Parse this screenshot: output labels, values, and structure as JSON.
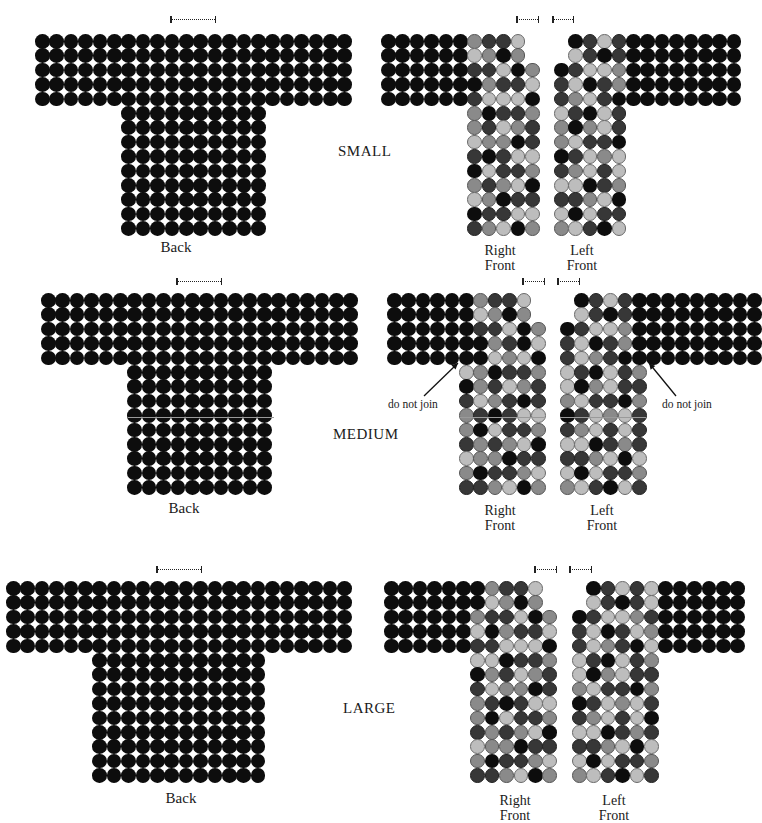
{
  "colors": {
    "D": "#0d0d0d",
    "K": "#373737",
    "M": "#8a8a8a",
    "L": "#bdbdbd"
  },
  "legend_keys": {
    "D": "black",
    "K": "dark gray",
    "M": "medium gray",
    "L": "light gray"
  },
  "sizes": [
    {
      "name": "SMALL",
      "label_pos": [
        338,
        143
      ],
      "back": {
        "label": "Back",
        "label_pos": [
          176,
          240
        ],
        "origin": [
          35,
          34
        ],
        "pitch": 14.4,
        "rows": [
          "DDDDDDDDDDDDDDDDDDDDDD",
          "DDDDDDDDDDDDDDDDDDDDDD",
          "DDDDDDDDDDDDDDDDDDDDDD",
          "DDDDDDDDDDDDDDDDDDDDDD",
          "DDDDDDDDDDDDDDDDDDDDDD",
          "......DDDDDDDDDD",
          "......DDDDDDDDDD",
          "......DDDDDDDDDD",
          "......DDDDDDDDDD",
          "......DDDDDDDDDD",
          "......DDDDDDDDDD",
          "......DDDDDDDDDD",
          "......DDDDDDDDDD",
          "......DDDDDDDDDD"
        ],
        "marker": [
          171,
          19,
          44
        ]
      },
      "right_front": {
        "label": "Right\nFront",
        "label_pos": [
          500,
          243
        ],
        "origin": [
          381,
          34
        ],
        "pitch": 14.4,
        "rows": [
          "DDDDDDMKKL",
          "DDDDDDLMDM",
          "DDDDDDKKLDM",
          "DDDDDDDMKKL",
          "DDDDDDKLLLD",
          "......MDKKM",
          "......MKLMK",
          "......LMMDK",
          "......KDKLL",
          "......DLKKM",
          "......MKMLD",
          "......LMDKK",
          "......DKKLL",
          "......KMLDM"
        ],
        "marker": [
          517,
          19,
          21
        ]
      },
      "left_front": {
        "label": "Left\nFront",
        "label_pos": [
          582,
          243
        ],
        "origin": [
          554,
          34
        ],
        "pitch": 14.4,
        "rows": [
          ".DKLKDDDDDDDD",
          ".LKDKDDDDDDDD",
          "DKLLMDDDDDDDD",
          "KLDKMDDDDDDDD",
          "KMLKDDDDDDDDD",
          "LKDLK",
          "MDMLK",
          "MLKKD",
          "DKLML",
          "KMLKL",
          "LLDKM",
          "KKMLD",
          "LDLKK",
          "MLKDL"
        ],
        "marker": [
          553,
          19,
          20
        ]
      },
      "notes": []
    },
    {
      "name": "MEDIUM",
      "label_pos": [
        333,
        426
      ],
      "back": {
        "label": "Back",
        "label_pos": [
          184,
          501
        ],
        "origin": [
          41,
          293
        ],
        "pitch": 14.4,
        "rows": [
          "DDDDDDDDDDDDDDDDDDDDDD",
          "DDDDDDDDDDDDDDDDDDDDDD",
          "DDDDDDDDDDDDDDDDDDDDDD",
          "DDDDDDDDDDDDDDDDDDDDDD",
          "DDDDDDDDDDDDDDDDDDDDDD",
          "......DDDDDDDDDD",
          "......DDDDDDDDDD",
          "......DDDDDDDDDD",
          "......DDDDDDDDDD",
          "......DDDDDDDDDD",
          "......DDDDDDDDDD",
          "......DDDDDDDDDD",
          "......DDDDDDDDDD",
          "......DDDDDDDDDD"
        ],
        "marker": [
          177,
          281,
          44
        ],
        "hline": [
          128,
          417,
          146
        ]
      },
      "right_front": {
        "label": "Right\nFront",
        "label_pos": [
          500,
          503
        ],
        "origin": [
          387,
          293
        ],
        "pitch": 14.4,
        "rows": [
          "DDDDDDMKKL",
          "DDDDDDLMDM",
          "DDDDDDKKLDM",
          "DDDDDDDMKDL",
          "DDDDDDDLMLD",
          ".....LMDKKM",
          ".....DMKLMK",
          ".....KLMKDK",
          ".....MKDKLL",
          ".....MDLKKM",
          ".....KMKMLD",
          ".....LMMDKK",
          ".....MDKKML",
          ".....KKMLDM"
        ],
        "marker": [
          523,
          281,
          21
        ],
        "hline": [
          460,
          417,
          84
        ]
      },
      "left_front": {
        "label": "Left\nFront",
        "label_pos": [
          602,
          503
        ],
        "origin": [
          560,
          293
        ],
        "pitch": 14.4,
        "rows": [
          ".DKLKDDDDDDDDD",
          ".LKDKDDDDDDDDD",
          "DKLLMDDDDDDDDD",
          "KLDKMDDDDDDDDD",
          "KLMKDDDDDDDDDD",
          "LKDLKM",
          "LDMLKK",
          "MLKKDM",
          "DKLMLK",
          "KMLKLK",
          "LLDKMK",
          "KKMLDL",
          "LDLKKM",
          "MLKDLK"
        ],
        "marker": [
          558,
          281,
          21
        ],
        "hline": [
          560,
          417,
          86
        ]
      },
      "notes": [
        {
          "text": "do not join",
          "pos": [
            388,
            398
          ],
          "arrow": [
            [
              424,
              396
            ],
            [
              458,
              363
            ]
          ]
        },
        {
          "text": "do not join",
          "pos": [
            662,
            398
          ],
          "arrow": [
            [
              676,
              396
            ],
            [
              649,
              363
            ]
          ]
        }
      ]
    },
    {
      "name": "LARGE",
      "label_pos": [
        343,
        700
      ],
      "back": {
        "label": "Back",
        "label_pos": [
          181,
          791
        ],
        "origin": [
          6,
          581
        ],
        "pitch": 14.4,
        "rows": [
          "DDDDDDDDDDDDDDDDDDDDDDDD",
          "DDDDDDDDDDDDDDDDDDDDDDDD",
          "DDDDDDDDDDDDDDDDDDDDDDDD",
          "DDDDDDDDDDDDDDDDDDDDDDDD",
          "DDDDDDDDDDDDDDDDDDDDDDDD",
          "......DDDDDDDDDDDD",
          "......DDDDDDDDDDDD",
          "......DDDDDDDDDDDD",
          "......DDDDDDDDDDDD",
          "......DDDDDDDDDDDD",
          "......DDDDDDDDDDDD",
          "......DDDDDDDDDDDD",
          "......DDDDDDDDDDDD",
          "......DDDDDDDDDDDD"
        ],
        "marker": [
          157,
          569,
          44
        ]
      },
      "right_front": {
        "label": "Right\nFront",
        "label_pos": [
          515,
          793
        ],
        "origin": [
          384,
          581
        ],
        "pitch": 14.4,
        "rows": [
          "DDDDDDDMKKL",
          "DDDDDDDLMDM",
          "DDDDDDMKKLDM",
          "DDDDDDLDMKKL",
          "DDDDDDKKLLLD",
          "......LLDKKM",
          "......DMKLMK",
          "......KLMMDK",
          "......MKDKLL",
          "......MDLKKM",
          "......KMKMLD",
          "......LMMDKK",
          "......MDKKML",
          "......KKMLDM"
        ],
        "marker": [
          535,
          569,
          21
        ]
      },
      "left_front": {
        "label": "Left\nFront",
        "label_pos": [
          614,
          793
        ],
        "origin": [
          572,
          581
        ],
        "pitch": 14.4,
        "rows": [
          ".DKLKLDDDDDD",
          ".LKDKLDDDDDD",
          "DKLLMKDDDDDD",
          "KLDKLMDDDDDD",
          "KLMKDLDDDDDD",
          "LKDLKM",
          "LDMLKK",
          "MLKKDM",
          "DKLMLK",
          "KMLKLD",
          "LLDKMK",
          "KKMLDL",
          "LDLKKM",
          "MLKDLK"
        ],
        "marker": [
          570,
          569,
          21
        ]
      },
      "notes": []
    }
  ]
}
